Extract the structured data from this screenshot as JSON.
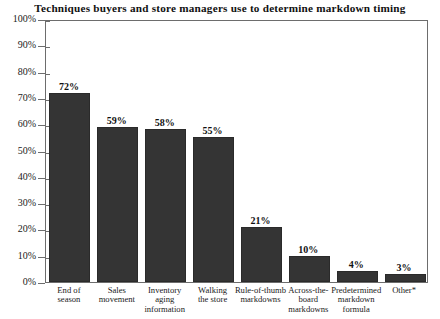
{
  "chart_data": {
    "type": "bar",
    "title": "Techniques buyers and store managers use to determine markdown timing",
    "xlabel": "",
    "ylabel": "",
    "ylim": [
      0,
      100
    ],
    "grid": false,
    "legend": null,
    "categories": [
      "End of season",
      "Sales movement",
      "Inventory aging information",
      "Walking the store",
      "Rule-of-thumb markdowns",
      "Across-the-board markdowns",
      "Predetermined markdown formula",
      "Other*"
    ],
    "values": [
      72,
      59,
      58,
      55,
      21,
      10,
      4,
      3
    ],
    "value_labels": [
      "72%",
      "59%",
      "58%",
      "55%",
      "21%",
      "10%",
      "4%",
      "3%"
    ],
    "ytick_labels": [
      "100%",
      "90%",
      "80%",
      "70%",
      "60%",
      "50%",
      "40%",
      "30%",
      "20%",
      "10%",
      "0%"
    ],
    "ytick_values": [
      100,
      90,
      80,
      70,
      60,
      50,
      40,
      30,
      20,
      10,
      0
    ],
    "bar_color": "#343434",
    "axis_color": "#6d6d6d",
    "text_color": "#1a1a1a"
  },
  "category_lines": [
    [
      "End of",
      "season"
    ],
    [
      "Sales",
      "movement"
    ],
    [
      "Inventory",
      "aging",
      "information"
    ],
    [
      "Walking",
      "the store"
    ],
    [
      "Rule-of-thumb",
      "markdowns"
    ],
    [
      "Across-the-",
      "board",
      "markdowns"
    ],
    [
      "Predetermined",
      "markdown",
      "formula"
    ],
    [
      "Other*"
    ]
  ]
}
